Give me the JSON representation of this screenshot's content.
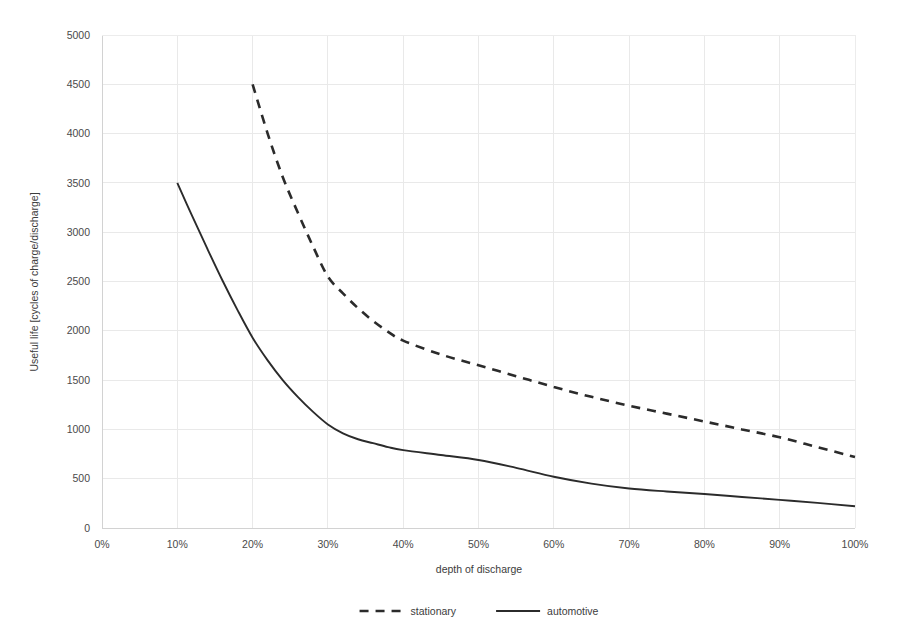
{
  "chart_data": {
    "type": "line",
    "title": "",
    "xlabel": "depth of discharge",
    "ylabel": "Useful life [cycles of charge/discharge]",
    "xlim": [
      0,
      100
    ],
    "ylim": [
      0,
      5000
    ],
    "x_tick_labels": [
      "0%",
      "10%",
      "20%",
      "30%",
      "40%",
      "50%",
      "60%",
      "70%",
      "80%",
      "90%",
      "100%"
    ],
    "x_tick_values": [
      0,
      10,
      20,
      30,
      40,
      50,
      60,
      70,
      80,
      90,
      100
    ],
    "y_tick_labels": [
      "0",
      "500",
      "1000",
      "1500",
      "2000",
      "2500",
      "3000",
      "3500",
      "4000",
      "4500",
      "5000"
    ],
    "y_tick_values": [
      0,
      500,
      1000,
      1500,
      2000,
      2500,
      3000,
      3500,
      4000,
      4500,
      5000
    ],
    "grid": true,
    "legend_position": "bottom",
    "series": [
      {
        "name": "stationary",
        "style": "dashed",
        "color": "#2b2b2b",
        "x": [
          20,
          22,
          24,
          26,
          28,
          30,
          32,
          34,
          36,
          38,
          40,
          45,
          50,
          55,
          60,
          65,
          70,
          75,
          80,
          85,
          90,
          95,
          100
        ],
        "values": [
          4500,
          4000,
          3560,
          3200,
          2860,
          2550,
          2380,
          2230,
          2100,
          1990,
          1900,
          1760,
          1650,
          1540,
          1430,
          1330,
          1240,
          1160,
          1080,
          1000,
          920,
          820,
          720
        ]
      },
      {
        "name": "automotive",
        "style": "solid",
        "color": "#2b2b2b",
        "x": [
          10,
          12,
          14,
          16,
          18,
          20,
          22,
          24,
          26,
          28,
          30,
          32,
          34,
          36,
          38,
          40,
          45,
          50,
          55,
          60,
          65,
          70,
          75,
          80,
          85,
          90,
          95,
          100
        ],
        "values": [
          3500,
          3160,
          2830,
          2510,
          2210,
          1930,
          1700,
          1500,
          1330,
          1180,
          1050,
          960,
          900,
          860,
          820,
          790,
          740,
          690,
          610,
          520,
          450,
          400,
          370,
          345,
          315,
          285,
          255,
          220
        ]
      }
    ]
  },
  "legend": {
    "items": [
      {
        "label": "stationary",
        "style": "dashed"
      },
      {
        "label": "automotive",
        "style": "solid"
      }
    ]
  }
}
